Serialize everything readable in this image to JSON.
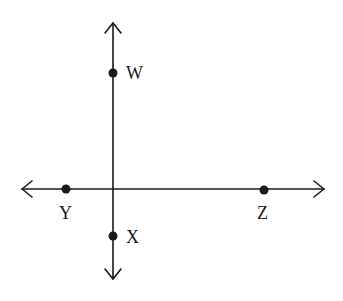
{
  "diagram": {
    "type": "perpendicular-lines",
    "colors": {
      "line": "#1a1a1a",
      "background": "#ffffff"
    },
    "lines": [
      {
        "name": "horizontal-line",
        "from": [
          22,
          189
        ],
        "to": [
          324,
          189
        ],
        "arrows": "both"
      },
      {
        "name": "vertical-line",
        "from": [
          113,
          23
        ],
        "to": [
          113,
          279
        ],
        "arrows": "both"
      }
    ],
    "points": [
      {
        "label": "W",
        "x": 113,
        "y": 73,
        "label_x": 126,
        "label_y": 79
      },
      {
        "label": "Y",
        "x": 66,
        "y": 189,
        "label_x": 59,
        "label_y": 219
      },
      {
        "label": "Z",
        "x": 264,
        "y": 190,
        "label_x": 257,
        "label_y": 219
      },
      {
        "label": "X",
        "x": 113,
        "y": 236,
        "label_x": 126,
        "label_y": 243
      }
    ]
  }
}
